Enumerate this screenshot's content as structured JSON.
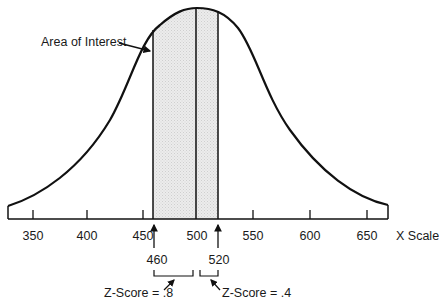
{
  "diagram": {
    "type": "normal-distribution-curve",
    "annotation": "Area of Interest",
    "axis_label": "X Scale",
    "ticks": [
      {
        "value": "350",
        "x": 33
      },
      {
        "value": "400",
        "x": 87
      },
      {
        "value": "450",
        "x": 143
      },
      {
        "value": "500",
        "x": 197
      },
      {
        "value": "550",
        "x": 253
      },
      {
        "value": "600",
        "x": 310
      },
      {
        "value": "650",
        "x": 367
      }
    ],
    "mean": 500,
    "shaded_region": {
      "from": 460,
      "to": 520,
      "fill": "#e6e6e6"
    },
    "markers": [
      {
        "value": "460",
        "z_label": "Z-Score = .8"
      },
      {
        "value": "520",
        "z_label": "Z-Score = .4"
      }
    ],
    "colors": {
      "line": "#111111",
      "shade": "#e6e6e6",
      "background": "#ffffff"
    }
  }
}
